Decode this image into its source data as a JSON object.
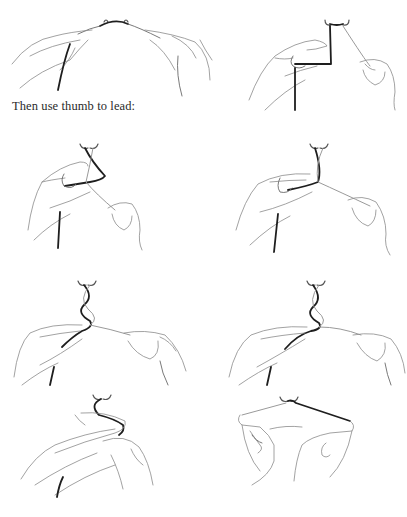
{
  "page": {
    "caption": "Then use thumb to lead:",
    "background": "#ffffff",
    "text_color": "#2a2a2a"
  },
  "illustrations": [
    {
      "id": 1,
      "row": 0,
      "col": "left",
      "depicts": "two hands holding cord stretched across a hook"
    },
    {
      "id": 2,
      "row": 0,
      "col": "right",
      "depicts": "left hand wrapping dark cord around fingers, right hand holding light cord"
    },
    {
      "id": 3,
      "row": 1,
      "col": "left",
      "depicts": "thumb leading cord under, cords crossing below hook"
    },
    {
      "id": 4,
      "row": 1,
      "col": "right",
      "depicts": "thumb pulling cord through crossing"
    },
    {
      "id": 5,
      "row": 2,
      "col": "left",
      "depicts": "figure-eight twist forming below hook"
    },
    {
      "id": 6,
      "row": 2,
      "col": "right",
      "depicts": "figure-eight twist tightened, cords pulled apart"
    },
    {
      "id": 7,
      "row": 3,
      "col": "left",
      "depicts": "hands crossed, loop of dark cord over fingers"
    },
    {
      "id": 8,
      "row": 3,
      "col": "right",
      "depicts": "both hands pulling cords taut forming knot at hook"
    }
  ]
}
